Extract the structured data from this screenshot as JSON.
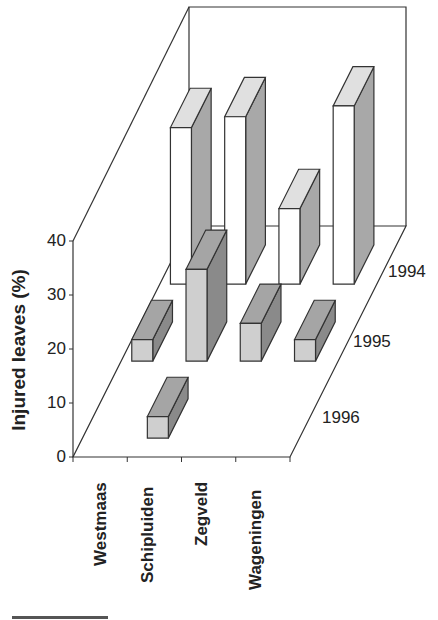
{
  "chart_data": {
    "type": "bar",
    "subtype": "3d-bar",
    "title": "",
    "ylabel": "Injured leaves (%)",
    "xlabel": "",
    "ylim": [
      0,
      40
    ],
    "yticks": [
      0,
      10,
      20,
      30,
      40
    ],
    "categories": [
      "Westmaas",
      "Schipluiden",
      "Zegveld",
      "Wageningen"
    ],
    "depth_labels": [
      "1994",
      "1995",
      "1996"
    ],
    "series": [
      {
        "name": "1994",
        "values": [
          29,
          31,
          14,
          33
        ],
        "color_front": "#ffffff",
        "color_top": "#e0e0e0",
        "color_side": "#a8a8a8"
      },
      {
        "name": "1995",
        "values": [
          4,
          17,
          7,
          4
        ],
        "color_front": "#cfcfcf",
        "color_top": "#a5a5a5",
        "color_side": "#8a8a8a"
      },
      {
        "name": "1996",
        "values": [
          0,
          4,
          0,
          0
        ],
        "color_front": "#cfcfcf",
        "color_top": "#a5a5a5",
        "color_side": "#8a8a8a"
      }
    ],
    "grid": false,
    "legend": "none"
  },
  "axis": {
    "ylabel": "Injured leaves (%)",
    "yticks": [
      "0",
      "10",
      "20",
      "30",
      "40"
    ],
    "categories": [
      "Westmaas",
      "Schipluiden",
      "Zegveld",
      "Wageningen"
    ],
    "depth": [
      "1994",
      "1995",
      "1996"
    ]
  }
}
